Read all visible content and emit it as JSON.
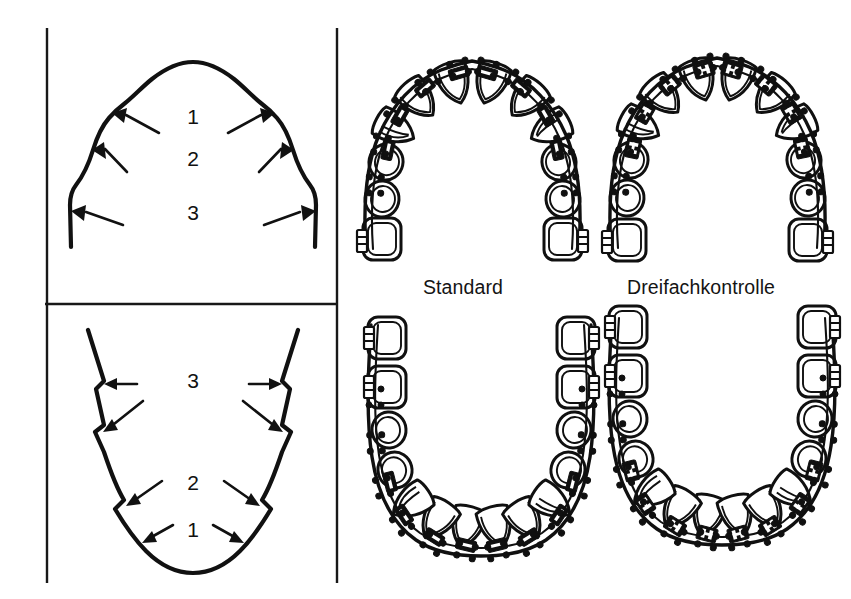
{
  "figure": {
    "background_color": "#ffffff",
    "ink_color": "#111111"
  },
  "panels": {
    "upper_left": {
      "name": "maxillary-arch-zones",
      "zone_labels": [
        "1",
        "2",
        "3"
      ],
      "zone_label_positions": [
        {
          "label": "1",
          "x": 193,
          "y": 124
        },
        {
          "label": "2",
          "x": 193,
          "y": 166
        },
        {
          "label": "3",
          "x": 193,
          "y": 220
        }
      ],
      "arrow_count": 6
    },
    "lower_left": {
      "name": "mandibular-arch-zones",
      "zone_labels": [
        "3",
        "2",
        "1"
      ],
      "zone_label_positions": [
        {
          "label": "3",
          "x": 193,
          "y": 388
        },
        {
          "label": "2",
          "x": 193,
          "y": 490
        },
        {
          "label": "1",
          "x": 193,
          "y": 537
        }
      ],
      "arrow_count": 8
    }
  },
  "captions": [
    {
      "id": "standard",
      "text": "Standard",
      "x": 423,
      "y": 276
    },
    {
      "id": "dreifachkontrolle",
      "text": "Dreifachkontrolle",
      "x": 627,
      "y": 276
    }
  ],
  "arches": [
    {
      "id": "upper-standard",
      "system": "Standard",
      "jaw": "maxilla",
      "appliance": "edgewise brackets with archwire",
      "teeth_per_side": 7
    },
    {
      "id": "upper-dreifachkontrolle",
      "system": "Dreifachkontrolle",
      "jaw": "maxilla",
      "appliance": "triple-control brackets with archwire",
      "teeth_per_side": 7
    },
    {
      "id": "lower-standard",
      "system": "Standard",
      "jaw": "mandible",
      "appliance": "edgewise brackets with archwire",
      "teeth_per_side": 7
    },
    {
      "id": "lower-dreifachkontrolle",
      "system": "Dreifachkontrolle",
      "jaw": "mandible",
      "appliance": "triple-control brackets with archwire",
      "teeth_per_side": 7
    }
  ],
  "frame": {
    "left_border_x": 47,
    "right_border_x": 337,
    "top_y": 28,
    "bottom_y": 583,
    "divider_y": 304
  }
}
